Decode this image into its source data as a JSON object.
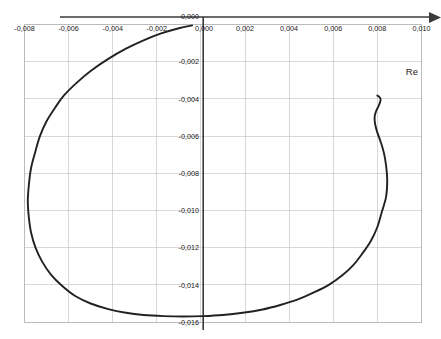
{
  "chart_data": {
    "type": "line",
    "title": "",
    "subtitle": "",
    "xlabel": "Re",
    "ylabel": "",
    "xlim": [
      -0.008,
      0.01
    ],
    "ylim": [
      -0.016,
      0.0
    ],
    "grid": true,
    "legend": null,
    "x_ticks": [
      -0.008,
      -0.006,
      -0.004,
      -0.002,
      0.0,
      0.002,
      0.004,
      0.006,
      0.008,
      0.01
    ],
    "x_tick_labels": [
      "-0,008",
      "-0,006",
      "-0,004",
      "-0,002",
      "0,000",
      "0,002",
      "0,004",
      "0,006",
      "0,008",
      "0,010"
    ],
    "y_ticks": [
      0.0,
      -0.002,
      -0.004,
      -0.006,
      -0.008,
      -0.01,
      -0.012,
      -0.014,
      -0.016
    ],
    "y_tick_labels": [
      "0,000",
      "-0,002",
      "-0,004",
      "-0,006",
      "-0,008",
      "-0,010",
      "-0,012",
      "-0,014",
      "-0,016"
    ],
    "series": [
      {
        "name": "impedance-arc",
        "color": "#222222",
        "x": [
          -0.0004,
          -0.001,
          -0.0018,
          -0.0026,
          -0.0034,
          -0.0042,
          -0.005,
          -0.0056,
          -0.0062,
          -0.0066,
          -0.007,
          -0.0073,
          -0.0075,
          -0.0077,
          -0.0078,
          -0.00785,
          -0.0078,
          -0.0077,
          -0.0075,
          -0.0072,
          -0.0068,
          -0.0063,
          -0.0057,
          -0.005,
          -0.0042,
          -0.0034,
          -0.0026,
          -0.0017,
          -0.0008,
          0.0001,
          0.001,
          0.0019,
          0.0028,
          0.0036,
          0.0044,
          0.0051,
          0.0058,
          0.0064,
          0.0069,
          0.0073,
          0.0077,
          0.008,
          0.0082,
          0.0084,
          0.00845,
          0.0084,
          0.0083,
          0.00815,
          0.008,
          0.0079,
          0.00788,
          0.00795,
          0.00805,
          0.00812,
          0.00815,
          0.0081,
          0.008
        ],
        "y": [
          -5e-05,
          -0.0002,
          -0.00048,
          -0.00085,
          -0.0013,
          -0.00185,
          -0.0025,
          -0.0031,
          -0.0038,
          -0.00445,
          -0.0052,
          -0.006,
          -0.0068,
          -0.0077,
          -0.0086,
          -0.0095,
          -0.0104,
          -0.0112,
          -0.012,
          -0.01275,
          -0.01345,
          -0.01405,
          -0.0146,
          -0.015,
          -0.0153,
          -0.0155,
          -0.01562,
          -0.01568,
          -0.0157,
          -0.01568,
          -0.01562,
          -0.0155,
          -0.01532,
          -0.01508,
          -0.01478,
          -0.01442,
          -0.014,
          -0.0135,
          -0.01295,
          -0.01235,
          -0.01165,
          -0.0109,
          -0.0101,
          -0.00925,
          -0.0084,
          -0.0076,
          -0.0069,
          -0.0063,
          -0.0058,
          -0.00535,
          -0.00495,
          -0.00465,
          -0.0044,
          -0.0042,
          -0.00402,
          -0.0039,
          -0.00382
        ]
      }
    ],
    "annotations": [
      {
        "text": "Re",
        "x": 0.0097,
        "y": -0.0027
      }
    ]
  },
  "axis": {
    "x_axis_name": "Re",
    "x_arrow": "arrow-right"
  }
}
